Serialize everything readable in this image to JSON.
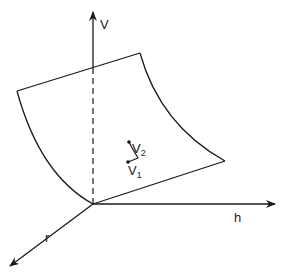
{
  "diagram": {
    "type": "3d-axes-surface",
    "axes": {
      "vertical": {
        "label": "V"
      },
      "horizontal": {
        "label": "h"
      },
      "depth": {
        "label": "r"
      }
    },
    "surface": {
      "description": "curved surface patch spanning the V-h-r axes"
    },
    "path_labels": {
      "start": {
        "label": "V",
        "subscript": "1"
      },
      "end": {
        "label": "V",
        "subscript": "2"
      }
    },
    "colors": {
      "stroke": "#1a1a1a",
      "background": "#ffffff"
    }
  }
}
